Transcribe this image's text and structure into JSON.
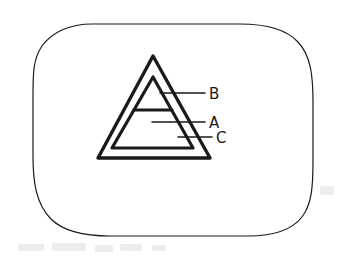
{
  "figure": {
    "medium": "hand-drawn scanned line drawing",
    "ink_color": "#1a1a1a",
    "paper_color": "#ffffff",
    "frame": {
      "name": "rounded-rectangle-border",
      "stroke_width": 1.2
    },
    "shapes": [
      {
        "id": "outer-triangle",
        "label": "C",
        "stroke_width": 3.4,
        "apex": [
          153,
          56
        ],
        "base_left": [
          99,
          158
        ],
        "base_right": [
          209,
          158
        ]
      },
      {
        "id": "inner-triangle",
        "label": "A",
        "stroke_width": 3.2,
        "apex": [
          153,
          77
        ],
        "base_left": [
          112,
          148
        ],
        "base_right": [
          193,
          148
        ]
      },
      {
        "id": "horizontal-divider",
        "label": "B",
        "stroke_width": 3.0,
        "from": [
          134,
          110
        ],
        "to": [
          172,
          110
        ]
      }
    ],
    "callouts": [
      {
        "id": "callout-b",
        "label": "B",
        "leader_from": [
          160,
          93
        ],
        "leader_to": [
          205,
          93
        ],
        "text_x": 209,
        "text_y": 99
      },
      {
        "id": "callout-a",
        "label": "A",
        "leader_from": [
          152,
          122
        ],
        "leader_to": [
          205,
          122
        ],
        "text_x": 209,
        "text_y": 128
      },
      {
        "id": "callout-c",
        "label": "C",
        "leader_from": [
          178,
          137
        ],
        "leader_to": [
          212,
          137
        ],
        "text_x": 216,
        "text_y": 143
      }
    ]
  }
}
